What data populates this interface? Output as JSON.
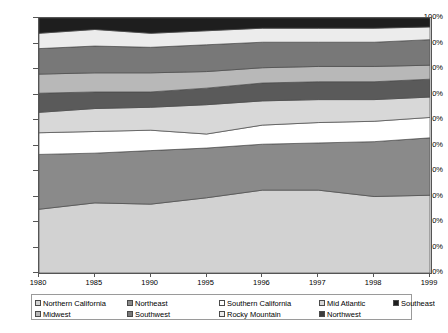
{
  "chart_data": {
    "type": "area",
    "stacked": true,
    "normalized": true,
    "title": "",
    "subtitle": "",
    "xlabel": "",
    "ylabel": "",
    "categories": [
      "1980",
      "1985",
      "1990",
      "1995",
      "1996",
      "1997",
      "1998",
      "1999"
    ],
    "x_tick_labels": [
      "1980",
      "1985",
      "1990",
      "1995",
      "1996",
      "1997",
      "1998",
      "1999"
    ],
    "y_tick_labels": [
      "0%",
      "10%",
      "20%",
      "30%",
      "40%",
      "50%",
      "60%",
      "70%",
      "80%",
      "90%",
      "100%"
    ],
    "y_tick_values": [
      0,
      10,
      20,
      30,
      40,
      50,
      60,
      70,
      80,
      90,
      100
    ],
    "ylim": [
      0,
      100
    ],
    "grid": false,
    "legend_position": "bottom",
    "series": [
      {
        "name": "Northern California",
        "color": "#d2d2d2",
        "values": [
          25.0,
          27.5,
          27.0,
          29.5,
          32.5,
          32.5,
          30.0,
          30.5
        ]
      },
      {
        "name": "Northeast",
        "color": "#8a8a8a",
        "values": [
          21.5,
          19.5,
          21.0,
          19.5,
          18.0,
          18.5,
          21.5,
          22.5
        ]
      },
      {
        "name": "Southern California",
        "color": "#ffffff",
        "values": [
          8.5,
          8.5,
          8.0,
          5.5,
          7.5,
          8.0,
          8.0,
          8.0
        ]
      },
      {
        "name": "Mid Atlantic",
        "color": "#d8d8d8",
        "values": [
          8.0,
          9.0,
          9.0,
          11.5,
          9.5,
          9.0,
          8.5,
          8.0
        ]
      },
      {
        "name": "Southeast",
        "color": "#5a5a5a",
        "values": [
          7.5,
          6.5,
          6.0,
          6.5,
          7.0,
          7.0,
          7.0,
          7.0
        ]
      },
      {
        "name": "Midwest",
        "color": "#b8b8b8",
        "values": [
          7.5,
          7.5,
          7.5,
          6.5,
          6.0,
          6.0,
          6.0,
          5.5
        ]
      },
      {
        "name": "Southwest",
        "color": "#787878",
        "values": [
          10.0,
          10.5,
          10.0,
          10.5,
          10.0,
          9.5,
          9.5,
          10.0
        ]
      },
      {
        "name": "Rocky Mountain",
        "color": "#ececec",
        "values": [
          6.0,
          6.5,
          5.5,
          5.5,
          5.5,
          5.5,
          5.5,
          5.0
        ]
      },
      {
        "name": "Northwest",
        "color": "#1e1e1e",
        "values": [
          6.0,
          4.5,
          6.0,
          5.0,
          4.0,
          4.0,
          4.0,
          3.5
        ]
      }
    ]
  },
  "legend": {
    "rows": [
      [
        {
          "label": "Northern California",
          "color": "#d2d2d2"
        },
        {
          "label": "Northeast",
          "color": "#8a8a8a"
        },
        {
          "label": "Southern California",
          "color": "#ffffff"
        },
        {
          "label": "Mid Atlantic",
          "color": "#d8d8d8"
        },
        {
          "label": "Southeast",
          "color": "#1e1e1e"
        }
      ],
      [
        {
          "label": "Midwest",
          "color": "#b8b8b8"
        },
        {
          "label": "Southwest",
          "color": "#787878"
        },
        {
          "label": "Rocky Mountain",
          "color": "#ececec"
        },
        {
          "label": "Northwest",
          "color": "#3c3c3c"
        }
      ]
    ]
  },
  "axis": {
    "line_color": "#555555",
    "band_stroke": "#4a4a4a"
  }
}
